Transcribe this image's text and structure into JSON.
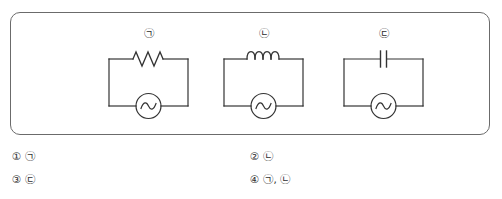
{
  "figure": {
    "frame_color": "#6b6b6b",
    "line_color": "#333333",
    "circuits": [
      {
        "label": "㉠",
        "component": "resistor",
        "component_icon": "resistor-zigzag-icon",
        "source": "ac-source",
        "source_icon": "ac-source-sine-icon"
      },
      {
        "label": "㉡",
        "component": "inductor",
        "component_icon": "inductor-coil-icon",
        "source": "ac-source",
        "source_icon": "ac-source-sine-icon"
      },
      {
        "label": "㉢",
        "component": "capacitor",
        "component_icon": "capacitor-plates-icon",
        "source": "ac-source",
        "source_icon": "ac-source-sine-icon"
      }
    ]
  },
  "answers": {
    "options": [
      {
        "number": "①",
        "text": "㉠"
      },
      {
        "number": "②",
        "text": "㉡"
      },
      {
        "number": "③",
        "text": "㉢"
      },
      {
        "number": "④",
        "text": "㉠, ㉡"
      }
    ]
  }
}
